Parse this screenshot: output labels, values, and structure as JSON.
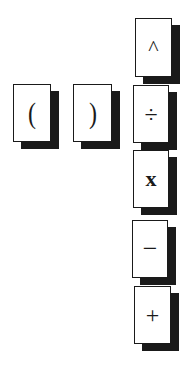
{
  "keypad": {
    "keys": [
      {
        "id": "open-paren",
        "label": "("
      },
      {
        "id": "close-paren",
        "label": ")"
      },
      {
        "id": "power",
        "label": "^"
      },
      {
        "id": "divide",
        "label": "÷"
      },
      {
        "id": "multiply",
        "label": "x"
      },
      {
        "id": "subtract",
        "label": "−"
      },
      {
        "id": "add",
        "label": "+"
      }
    ]
  },
  "colors": {
    "background": "#ffffff",
    "key_face": "#ffffff",
    "key_border": "#1a1a1a",
    "key_shadow": "#1a1a1a"
  }
}
